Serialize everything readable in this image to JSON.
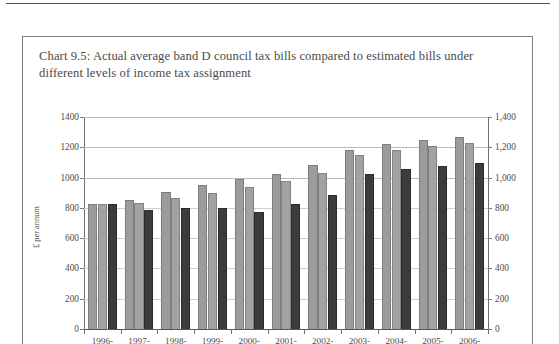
{
  "page": {
    "background": "#ffffff",
    "rule_color": "#55565a",
    "frame_color": "#7a7b7e"
  },
  "chart_data": {
    "type": "bar",
    "title": "Chart 9.5: Actual average band D council tax bills compared to estimated bills under different levels of income tax assignment",
    "xlabel": "",
    "ylabel": "£ per annum",
    "ylim": [
      0,
      1400
    ],
    "grid": true,
    "legend": "none",
    "categories": [
      "1996-",
      "1997-",
      "1998-",
      "1999-",
      "2000-",
      "2001-",
      "2002-",
      "2003-",
      "2004-",
      "2005-",
      "2006-"
    ],
    "left_axis_ticks": [
      "0",
      "200",
      "400",
      "600",
      "800",
      "1000",
      "1200",
      "1400"
    ],
    "right_axis_ticks": [
      "0",
      "200",
      "400",
      "600",
      "800",
      "1,000",
      "1,200",
      "1,400"
    ],
    "tick_values": [
      0,
      200,
      400,
      600,
      800,
      1000,
      1200,
      1400
    ],
    "series": [
      {
        "name": "series-1-light",
        "color": "#9c9c9c",
        "values": [
          825,
          855,
          905,
          950,
          990,
          1025,
          1080,
          1185,
          1220,
          1245,
          1270
        ]
      },
      {
        "name": "series-2-light",
        "color": "#a2a2a2",
        "values": [
          825,
          835,
          868,
          900,
          940,
          980,
          1032,
          1150,
          1185,
          1208,
          1228
        ]
      },
      {
        "name": "series-3-dark",
        "color": "#3c3c3c",
        "values": [
          825,
          785,
          797,
          800,
          772,
          825,
          888,
          1025,
          1055,
          1075,
          1098
        ]
      }
    ]
  }
}
